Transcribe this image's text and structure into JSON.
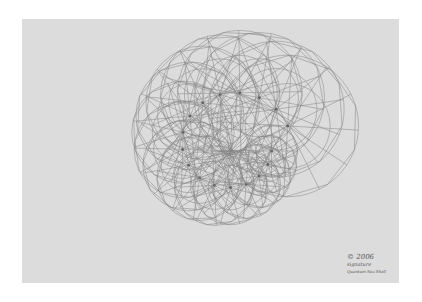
{
  "artwork": {
    "subject": "pencil-drawn nautilus-like spiral of overlapping geodesic circles on grey paper",
    "paper_color": "#dcdcdc",
    "line_color": "#555555",
    "signature": {
      "line1": "© 2006",
      "line2": "signature",
      "line3": "Quantum Sea Shell"
    }
  }
}
